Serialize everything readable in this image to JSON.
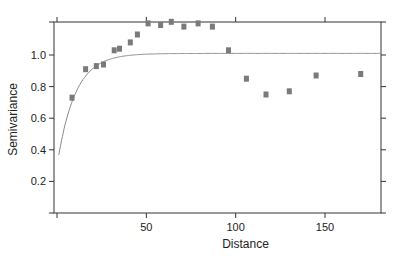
{
  "chart_data": {
    "type": "scatter",
    "title": "",
    "xlabel": "Distance",
    "ylabel": "Semivariance",
    "xlim": [
      0,
      182
    ],
    "ylim": [
      0,
      1.22
    ],
    "grid": false,
    "legend": null,
    "x_ticks": [
      50,
      100,
      150
    ],
    "x_tick_labels": [
      "50",
      "100",
      "150"
    ],
    "x_ticks_minor_top_bottom": [
      0,
      50,
      100,
      150
    ],
    "y_ticks": [
      0.2,
      0.4,
      0.6,
      0.8,
      1.0
    ],
    "y_tick_labels": [
      "0.2",
      "0.4",
      "0.6",
      "0.8",
      "1.0"
    ],
    "series": [
      {
        "name": "empirical semivariance",
        "kind": "points",
        "marker": "square",
        "color": "#7a7a7a",
        "x": [
          8.4,
          16,
          22,
          26,
          32,
          35,
          41,
          45,
          51,
          58,
          64,
          71,
          79,
          87,
          96,
          106,
          117,
          130,
          145,
          170
        ],
        "y": [
          0.73,
          0.91,
          0.93,
          0.94,
          1.03,
          1.04,
          1.08,
          1.13,
          1.2,
          1.19,
          1.21,
          1.18,
          1.2,
          1.18,
          1.03,
          0.85,
          0.75,
          0.77,
          0.87,
          0.88
        ]
      },
      {
        "name": "fitted variogram model",
        "kind": "line",
        "color": "#8a8a8a",
        "model": "exponential",
        "nugget": 0.3,
        "sill": 1.01,
        "range": 10,
        "x_start": 1,
        "x_end": 182
      }
    ]
  },
  "colors": {
    "axis": "#333333",
    "points": "#7a7a7a",
    "curve": "#8a8a8a",
    "background": "#ffffff"
  }
}
